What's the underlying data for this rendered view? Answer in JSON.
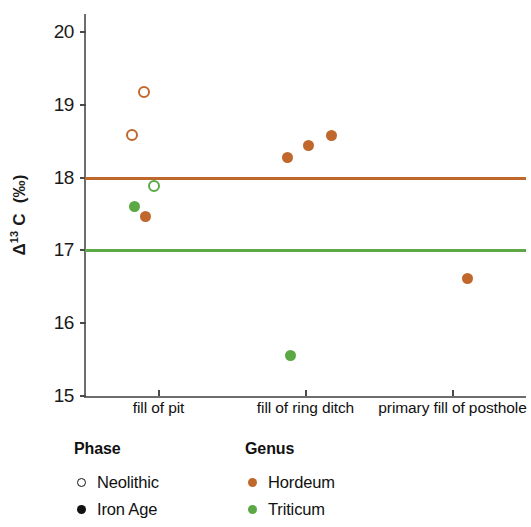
{
  "chart_data": {
    "type": "scatter",
    "title": "",
    "xlabel": "",
    "ylabel": "Δ¹³C (‰)",
    "ylabel_parts": {
      "prefix": "Δ",
      "sup": "13",
      "suffix": " C  (‰)"
    },
    "ylim": [
      15,
      20
    ],
    "yticks": [
      15,
      16,
      17,
      18,
      19,
      20
    ],
    "ytick_labels": [
      "15",
      "16",
      "17",
      "18",
      "19",
      "20"
    ],
    "grid": false,
    "categories": [
      "fill of pit",
      "fill of ring ditch",
      "primary fill of posthole"
    ],
    "legend_position": "below-left",
    "reference_lines": [
      {
        "name": "Hordeum modern baseline",
        "y": 18.0,
        "color": "#C0672B"
      },
      {
        "name": "Triticum modern baseline",
        "y": 17.0,
        "color": "#5BA845"
      }
    ],
    "series": [
      {
        "name": "Hordeum",
        "genus": "Hordeum",
        "color": "#C0672B",
        "points": [
          {
            "category": "fill of pit",
            "x_offset": -0.1,
            "y": 19.18,
            "phase": "Neolithic",
            "marker": "open"
          },
          {
            "category": "fill of pit",
            "x_offset": -0.18,
            "y": 18.59,
            "phase": "Neolithic",
            "marker": "open"
          },
          {
            "category": "fill of pit",
            "x_offset": -0.09,
            "y": 17.46,
            "phase": "Iron Age",
            "marker": "filled"
          },
          {
            "category": "fill of ring ditch",
            "x_offset": -0.12,
            "y": 18.27,
            "phase": "Iron Age",
            "marker": "filled"
          },
          {
            "category": "fill of ring ditch",
            "x_offset": 0.02,
            "y": 18.44,
            "phase": "Iron Age",
            "marker": "filled"
          },
          {
            "category": "fill of ring ditch",
            "x_offset": 0.18,
            "y": 18.58,
            "phase": "Iron Age",
            "marker": "filled"
          },
          {
            "category": "primary fill of posthole",
            "x_offset": 0.1,
            "y": 16.62,
            "phase": "Iron Age",
            "marker": "filled"
          }
        ]
      },
      {
        "name": "Triticum",
        "genus": "Triticum",
        "color": "#5BA845",
        "points": [
          {
            "category": "fill of pit",
            "x_offset": -0.03,
            "y": 17.88,
            "phase": "Neolithic",
            "marker": "open"
          },
          {
            "category": "fill of pit",
            "x_offset": -0.16,
            "y": 17.6,
            "phase": "Iron Age",
            "marker": "filled"
          },
          {
            "category": "fill of ring ditch",
            "x_offset": -0.1,
            "y": 15.55,
            "phase": "Iron Age",
            "marker": "filled"
          }
        ]
      }
    ]
  },
  "legend": {
    "phase": {
      "title": "Phase",
      "items": [
        {
          "label": "Neolithic",
          "marker": "open",
          "color": "#111111"
        },
        {
          "label": "Iron Age",
          "marker": "filled",
          "color": "#111111"
        }
      ]
    },
    "genus": {
      "title": "Genus",
      "items": [
        {
          "label": "Hordeum",
          "marker": "filled",
          "color": "#C0672B"
        },
        {
          "label": "Triticum",
          "marker": "filled",
          "color": "#5BA845"
        }
      ]
    }
  },
  "axes": {
    "y_tick_labels": [
      "20",
      "19",
      "18",
      "17",
      "16",
      "15"
    ],
    "x_tick_labels": [
      "fill of pit",
      "fill of ring ditch",
      "primary fill of posthole"
    ]
  },
  "colors": {
    "hordeum": "#C0672B",
    "triticum": "#5BA845",
    "axis": "#6D6D6D",
    "text": "#111111"
  }
}
